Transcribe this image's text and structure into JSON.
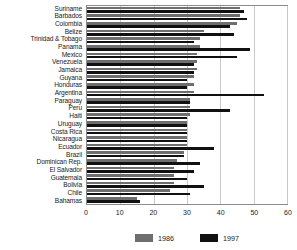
{
  "chart_data": {
    "type": "bar",
    "orientation": "horizontal",
    "title": "",
    "xlabel": "",
    "ylabel": "",
    "xlim": [
      0,
      60
    ],
    "xticks": [
      0,
      10,
      20,
      30,
      40,
      50,
      60
    ],
    "grid": true,
    "legend_position": "bottom",
    "categories": [
      "Suriname",
      "Barbados",
      "Colombia",
      "Belize",
      "Trinidad & Tobago",
      "Panama",
      "Mexico",
      "Venezuela",
      "Jamaica",
      "Guyana",
      "Honduras",
      "Argentina",
      "Paraguay",
      "Peru",
      "Haiti",
      "Uruguay",
      "Costa Rica",
      "Nicaragua",
      "Ecuador",
      "Brazil",
      "Dominican Rep.",
      "El Salvador",
      "Guatemala",
      "Bolivia",
      "Chile",
      "Bahamas"
    ],
    "series": [
      {
        "name": "1986",
        "color": "#6e6e6e",
        "values": [
          46,
          46,
          45,
          35,
          34,
          34,
          33,
          33,
          33,
          32,
          32,
          32,
          31,
          31,
          31,
          30,
          30,
          30,
          30,
          29,
          27,
          26,
          26,
          26,
          25,
          15
        ]
      },
      {
        "name": "1997",
        "color": "#111111",
        "values": [
          47,
          48,
          43,
          44,
          32,
          49,
          45,
          32,
          32,
          30,
          30,
          53,
          31,
          43,
          30,
          30,
          30,
          30,
          38,
          29,
          34,
          32,
          30,
          35,
          31,
          16
        ]
      }
    ]
  },
  "legend": {
    "items": [
      {
        "label": "1986",
        "color": "#6e6e6e"
      },
      {
        "label": "1997",
        "color": "#111111"
      }
    ]
  },
  "axis": {
    "x_tick_labels": [
      "0",
      "10",
      "20",
      "30",
      "40",
      "50",
      "60"
    ]
  }
}
